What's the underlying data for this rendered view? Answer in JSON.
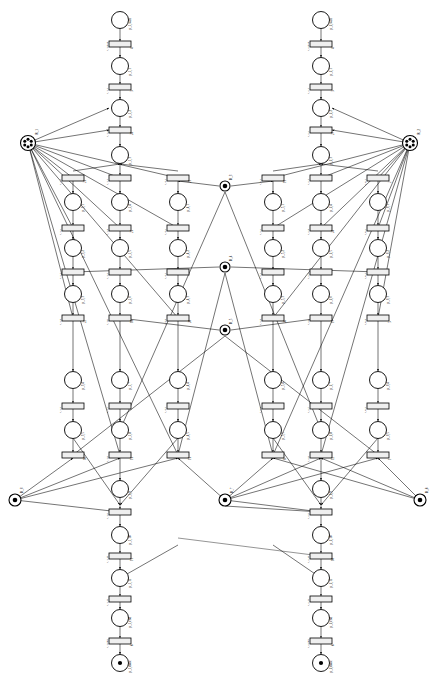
{
  "figure": {
    "kind": "petri-net",
    "canvas": {
      "width": 436,
      "height": 681
    },
    "background": "#ffffff",
    "stroke": "#000000",
    "transition_fill": "#efefef"
  },
  "legend": {
    "place_symbol": "circle",
    "transition_symbol": "rectangle",
    "token_symbol": "filled-dot"
  },
  "resources": [
    {
      "id": "r-left-top",
      "label": "R_1",
      "tokens": 6,
      "cx": 28,
      "cy": 143,
      "r": 7.5
    },
    {
      "id": "r-right-top",
      "label": "R_2",
      "tokens": 6,
      "cx": 410,
      "cy": 143,
      "r": 7.5
    },
    {
      "id": "r-mid-1",
      "label": "R_3",
      "tokens": 1,
      "cx": 225,
      "cy": 186,
      "r": 5.0
    },
    {
      "id": "r-mid-2",
      "label": "R_4",
      "tokens": 1,
      "cx": 225,
      "cy": 267,
      "r": 5.0
    },
    {
      "id": "r-mid-3",
      "label": "R_5",
      "tokens": 1,
      "cx": 225,
      "cy": 330,
      "r": 5.0
    },
    {
      "id": "r-left-bot",
      "label": "R_6",
      "tokens": 1,
      "cx": 15,
      "cy": 500,
      "r": 6.0
    },
    {
      "id": "r-mid-bot",
      "label": "R_7",
      "tokens": 1,
      "cx": 225,
      "cy": 500,
      "r": 6.0
    },
    {
      "id": "r-right-bot",
      "label": "R_8",
      "tokens": 1,
      "cx": 420,
      "cy": 500,
      "r": 6.0
    }
  ],
  "columns": [
    {
      "id": "c1",
      "x": 73
    },
    {
      "id": "c2",
      "x": 120
    },
    {
      "id": "c3",
      "x": 178
    },
    {
      "id": "c4",
      "x": 273
    },
    {
      "id": "c5",
      "x": 321
    },
    {
      "id": "c6",
      "x": 378
    }
  ],
  "chains": {
    "left_main": {
      "x": 120,
      "nodes": [
        {
          "type": "place",
          "y": 20,
          "label": "p_1,start",
          "tokens": 0
        },
        {
          "type": "trans",
          "y": 44,
          "label": "t_1,start",
          "weight": "4"
        },
        {
          "type": "place",
          "y": 66,
          "label": "p_1,1",
          "tokens": 0
        },
        {
          "type": "trans",
          "y": 87,
          "label": "t_1,1",
          "weight": "3"
        },
        {
          "type": "place",
          "y": 108,
          "label": "p_1,2",
          "tokens": 0
        },
        {
          "type": "trans",
          "y": 130,
          "label": "t_1,2",
          "weight": "28"
        },
        {
          "type": "place",
          "y": 155,
          "label": "p_1,3",
          "tokens": 0
        },
        {
          "type": "trans",
          "y": 178,
          "label": "t_1,3",
          "weight": ""
        },
        {
          "type": "place",
          "y": 202,
          "label": "p_1,4",
          "tokens": 0
        },
        {
          "type": "trans",
          "y": 228,
          "label": "t_1,4",
          "weight": "25"
        },
        {
          "type": "place",
          "y": 248,
          "label": "p_1,5",
          "tokens": 0
        },
        {
          "type": "trans",
          "y": 272,
          "label": "t_1,5",
          "weight": ""
        },
        {
          "type": "place",
          "y": 294,
          "label": "p_1,6",
          "tokens": 0
        },
        {
          "type": "trans",
          "y": 318,
          "label": "t_1,6",
          "weight": "18"
        },
        {
          "type": "place",
          "y": 380,
          "label": "p_1,7",
          "tokens": 0
        },
        {
          "type": "trans",
          "y": 406,
          "label": "t_1,7",
          "weight": ""
        },
        {
          "type": "place",
          "y": 430,
          "label": "p_1,8",
          "tokens": 0
        },
        {
          "type": "trans",
          "y": 455,
          "label": "t_1,8",
          "weight": "13"
        },
        {
          "type": "place",
          "y": 489,
          "label": "p_1,9",
          "tokens": 0
        },
        {
          "type": "trans",
          "y": 512,
          "label": "t_1,9",
          "weight": ""
        },
        {
          "type": "place",
          "y": 535,
          "label": "p_1,10",
          "tokens": 0
        },
        {
          "type": "trans",
          "y": 556,
          "label": "t_1,10",
          "weight": "11"
        },
        {
          "type": "place",
          "y": 578,
          "label": "p_1,11",
          "tokens": 0
        },
        {
          "type": "trans",
          "y": 599,
          "label": "t_1,11",
          "weight": ""
        },
        {
          "type": "place",
          "y": 618,
          "label": "p_1,end",
          "tokens": 0
        },
        {
          "type": "trans",
          "y": 641,
          "label": "t_1,end",
          "weight": "6"
        },
        {
          "type": "place",
          "y": 663,
          "label": "p_1,done",
          "tokens": 1
        }
      ]
    },
    "right_main": {
      "x": 321,
      "nodes": [
        {
          "type": "place",
          "y": 20,
          "label": "p_2,start",
          "tokens": 0
        },
        {
          "type": "trans",
          "y": 44,
          "label": "t_2,start",
          "weight": "4"
        },
        {
          "type": "place",
          "y": 66,
          "label": "p_2,1",
          "tokens": 0
        },
        {
          "type": "trans",
          "y": 87,
          "label": "t_2,1",
          "weight": "3"
        },
        {
          "type": "place",
          "y": 108,
          "label": "p_2,2",
          "tokens": 0
        },
        {
          "type": "trans",
          "y": 130,
          "label": "t_2,2",
          "weight": "27"
        },
        {
          "type": "place",
          "y": 155,
          "label": "p_2,3",
          "tokens": 0
        },
        {
          "type": "trans",
          "y": 178,
          "label": "t_2,3",
          "weight": ""
        },
        {
          "type": "place",
          "y": 202,
          "label": "p_2,4",
          "tokens": 0
        },
        {
          "type": "trans",
          "y": 228,
          "label": "t_2,4",
          "weight": "24"
        },
        {
          "type": "place",
          "y": 248,
          "label": "p_2,5",
          "tokens": 0
        },
        {
          "type": "trans",
          "y": 272,
          "label": "t_2,5",
          "weight": ""
        },
        {
          "type": "place",
          "y": 294,
          "label": "p_2,6",
          "tokens": 0
        },
        {
          "type": "trans",
          "y": 318,
          "label": "t_2,6",
          "weight": "17"
        },
        {
          "type": "place",
          "y": 380,
          "label": "p_2,7",
          "tokens": 0
        },
        {
          "type": "trans",
          "y": 406,
          "label": "t_2,7",
          "weight": ""
        },
        {
          "type": "place",
          "y": 430,
          "label": "p_2,8",
          "tokens": 0
        },
        {
          "type": "trans",
          "y": 455,
          "label": "t_2,8",
          "weight": "12"
        },
        {
          "type": "place",
          "y": 489,
          "label": "p_2,9",
          "tokens": 0
        },
        {
          "type": "trans",
          "y": 512,
          "label": "t_2,9",
          "weight": ""
        },
        {
          "type": "place",
          "y": 535,
          "label": "p_2,10",
          "tokens": 0
        },
        {
          "type": "trans",
          "y": 556,
          "label": "t_2,10",
          "weight": "10"
        },
        {
          "type": "place",
          "y": 578,
          "label": "p_2,11",
          "tokens": 0
        },
        {
          "type": "trans",
          "y": 599,
          "label": "t_2,11",
          "weight": ""
        },
        {
          "type": "place",
          "y": 618,
          "label": "p_2,end",
          "tokens": 0
        },
        {
          "type": "trans",
          "y": 641,
          "label": "t_2,end",
          "weight": "6"
        },
        {
          "type": "place",
          "y": 663,
          "label": "p_2,done",
          "tokens": 1
        }
      ]
    },
    "side_columns": [
      {
        "x": 73,
        "labels": [
          "p_3,1",
          "t_3,1",
          "p_3,2",
          "t_3,2",
          "p_3,3",
          "t_3,3",
          "p_3,4",
          "t_3,4",
          "p_3,5",
          "t_3,5"
        ],
        "weights": [
          "23",
          "",
          "",
          "22",
          "",
          "16",
          "",
          "14",
          ""
        ]
      },
      {
        "x": 178,
        "labels": [
          "p_4,1",
          "t_4,1",
          "p_4,2",
          "t_4,2",
          "p_4,3",
          "t_4,3",
          "p_4,4",
          "t_4,4",
          "p_4,5",
          "t_4,5"
        ],
        "weights": [
          "21",
          "",
          "",
          "20",
          "",
          "15",
          "",
          "9",
          ""
        ]
      },
      {
        "x": 273,
        "labels": [
          "p_5,1",
          "t_5,1",
          "p_5,2",
          "t_5,2",
          "p_5,3",
          "t_5,3",
          "p_5,4",
          "t_5,4",
          "p_5,5",
          "t_5,5"
        ],
        "weights": [
          "19",
          "",
          "",
          "26",
          "",
          "8",
          "",
          "7",
          ""
        ]
      },
      {
        "x": 378,
        "labels": [
          "p_6,1",
          "t_6,1",
          "p_6,2",
          "t_6,2",
          "p_6,3",
          "t_6,3",
          "p_6,4",
          "t_6,4",
          "p_6,5",
          "t_6,5"
        ],
        "weights": [
          "2",
          "",
          "",
          "5",
          "",
          "1",
          "",
          "",
          ""
        ]
      }
    ],
    "side_rows": [
      {
        "type": "trans",
        "y": 178
      },
      {
        "type": "place",
        "y": 202
      },
      {
        "type": "trans",
        "y": 228
      },
      {
        "type": "place",
        "y": 248
      },
      {
        "type": "trans",
        "y": 272
      },
      {
        "type": "place",
        "y": 294
      },
      {
        "type": "trans",
        "y": 318
      },
      {
        "type": "place",
        "y": 380
      },
      {
        "type": "trans",
        "y": 406
      },
      {
        "type": "place",
        "y": 430
      },
      {
        "type": "trans",
        "y": 455
      }
    ]
  },
  "geometry": {
    "place_radius": 8.5,
    "place_radius_small": 7.0,
    "transition_width": 22,
    "transition_height": 6
  }
}
